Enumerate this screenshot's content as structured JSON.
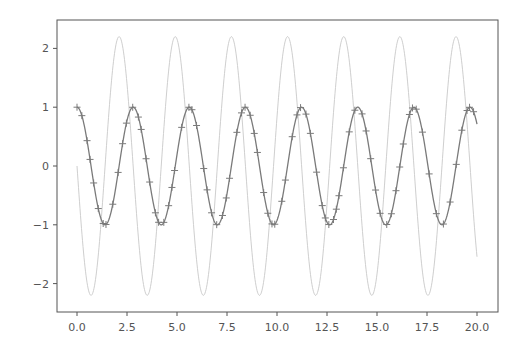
{
  "chart_data": {
    "type": "line",
    "title": "",
    "xlabel": "",
    "ylabel": "",
    "xlim": [
      -1.0,
      21.05
    ],
    "ylim": [
      -2.48,
      2.48
    ],
    "grid": false,
    "legend": null,
    "x_ticks": [
      0.0,
      2.5,
      5.0,
      7.5,
      10.0,
      12.5,
      15.0,
      17.5,
      20.0
    ],
    "x_tick_labels": [
      "0.0",
      "2.5",
      "5.0",
      "7.5",
      "10.0",
      "12.5",
      "15.0",
      "17.5",
      "20.0"
    ],
    "y_ticks": [
      -2,
      -1,
      0,
      1,
      2
    ],
    "y_tick_labels": [
      "−2",
      "−1",
      "0",
      "1",
      "2"
    ],
    "series": [
      {
        "name": "light curve (≈ -2.2·sin(2.24x))",
        "color": "#c8c8c8",
        "style": "thin line",
        "amplitude": 2.2,
        "omega": 2.238,
        "phase": "sin",
        "sign": -1,
        "x_range": [
          0,
          20
        ],
        "approx_values": {
          "x": [
            0,
            0.7,
            2.1,
            3.5,
            4.9,
            6.3,
            7.7,
            9.1,
            10.5,
            11.9,
            13.3,
            14.7,
            16.1,
            17.5,
            18.9,
            20.0
          ],
          "y": [
            0,
            -2.2,
            2.2,
            -2.2,
            2.2,
            -2.2,
            2.2,
            -2.2,
            2.2,
            -2.2,
            2.2,
            -2.2,
            2.2,
            -2.2,
            2.2,
            -1.5
          ]
        }
      },
      {
        "name": "dark curve (≈ cos(2.24x)) with + markers",
        "color": "#7a7a7a",
        "marker": "+",
        "amplitude": 1.0,
        "omega": 2.238,
        "phase": "cos",
        "sign": 1,
        "x_range": [
          0,
          20
        ],
        "approx_values": {
          "x": [
            0,
            1.4,
            2.8,
            4.2,
            5.6,
            7.0,
            8.4,
            9.8,
            11.2,
            12.6,
            14.0,
            15.4,
            16.8,
            18.2,
            19.65,
            20.0
          ],
          "y": [
            1,
            -1,
            1,
            -1,
            1,
            -1,
            1,
            -1,
            1,
            -1,
            1,
            -1,
            1,
            -1,
            1,
            0.72
          ]
        }
      }
    ]
  },
  "layout": {
    "plot_left": 57,
    "plot_right": 498,
    "plot_top": 20,
    "plot_bottom": 312,
    "x0_px": 77,
    "px_per_x": 20,
    "y0_px": 166,
    "px_per_y": 58.8,
    "frame_color": "#555555",
    "tick_label_color": "#555555"
  }
}
